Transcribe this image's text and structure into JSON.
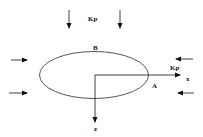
{
  "diagram": {
    "labels": {
      "kp_top": "Kp",
      "kp_right": "Kp",
      "point_b": "B",
      "point_a": "A",
      "axis_x": "x",
      "axis_z": "z"
    },
    "colors": {
      "stroke": "#111111",
      "ellipse": "#444444",
      "background": "#ffffff"
    }
  }
}
